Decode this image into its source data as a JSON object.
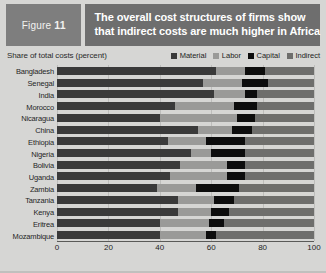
{
  "figure": {
    "tag_label": "Figure",
    "tag_number": "11",
    "title_line1": "The overall cost structures of firms show",
    "title_line2": "that indirect costs are much higher in Africa",
    "subhead": "Share of total costs (percent)",
    "source": ""
  },
  "colors": {
    "material": "#3a3a3a",
    "labor": "#9a9a98",
    "capital": "#0d0d0d",
    "indirect": "#6e6e6c",
    "tag_background": "#7e7e7e",
    "title_background": "#6e6e6e",
    "page_background": "#d6d6d4",
    "gridline": "#bdbdbb"
  },
  "legend": [
    {
      "label": "Material",
      "color": "#3a3a3a"
    },
    {
      "label": "Labor",
      "color": "#9a9a98"
    },
    {
      "label": "Capital",
      "color": "#0d0d0d"
    },
    {
      "label": "Indirect",
      "color": "#6e6e6c"
    }
  ],
  "chart_data": {
    "type": "bar",
    "orientation": "horizontal",
    "stacked": true,
    "title": "The overall cost structures of firms show that indirect costs are much higher in Africa",
    "xlabel": "Share of total costs (percent)",
    "ylabel": "",
    "xlim": [
      0,
      100
    ],
    "xticks": [
      0,
      20,
      40,
      60,
      80,
      100
    ],
    "grid": true,
    "legend_position": "top-right",
    "categories": [
      "Bangladesh",
      "Senegal",
      "India",
      "Morocco",
      "Nicaragua",
      "China",
      "Ethiopia",
      "Nigeria",
      "Bolivia",
      "Uganda",
      "Zambia",
      "Tanzania",
      "Kenya",
      "Eritrea",
      "Mozambique"
    ],
    "series": [
      {
        "name": "Material",
        "color": "#3a3a3a",
        "values": [
          62,
          57,
          61,
          46,
          40,
          55,
          43,
          52,
          48,
          44,
          39,
          47,
          47,
          40,
          40
        ]
      },
      {
        "name": "Labor",
        "color": "#9a9a98",
        "values": [
          11,
          15,
          12,
          23,
          30,
          13,
          15,
          8,
          18,
          22,
          15,
          14,
          13,
          19,
          18
        ]
      },
      {
        "name": "Capital",
        "color": "#0d0d0d",
        "values": [
          8,
          10,
          5,
          9,
          7,
          8,
          15,
          13,
          7,
          7,
          17,
          8,
          7,
          6,
          4
        ]
      },
      {
        "name": "Indirect",
        "color": "#6e6e6c",
        "values": [
          19,
          18,
          22,
          22,
          23,
          24,
          27,
          27,
          27,
          27,
          29,
          31,
          33,
          35,
          38
        ]
      }
    ]
  }
}
